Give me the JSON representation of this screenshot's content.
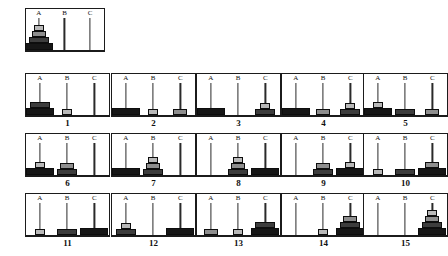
{
  "figure": {
    "peg_labels": [
      "A",
      "B",
      "C"
    ],
    "disk_colors": {
      "disk1_smallest": "#b9b9b9",
      "disk2": "#8e8e8e",
      "disk3": "#3d3d3d",
      "disk4_largest": "#161616"
    },
    "border_color": "#1b1b1b"
  },
  "chart_data": {
    "type": "diagram",
    "title": "",
    "subtitle": "",
    "peg_labels": [
      "A",
      "B",
      "C"
    ],
    "disk_count": 4,
    "initial_state": {
      "caption": "",
      "pegs": {
        "A": [
          4,
          3,
          2,
          1
        ],
        "B": [],
        "C": []
      }
    },
    "steps": [
      {
        "caption": "1",
        "pegs": {
          "A": [
            4,
            3
          ],
          "B": [
            1
          ],
          "C": []
        }
      },
      {
        "caption": "2",
        "pegs": {
          "A": [
            4
          ],
          "B": [
            1
          ],
          "C": [
            2
          ]
        }
      },
      {
        "caption": "3",
        "pegs": {
          "A": [
            4
          ],
          "B": [],
          "C": [
            3,
            1
          ]
        }
      },
      {
        "caption": "4",
        "pegs": {
          "A": [
            4
          ],
          "B": [
            2
          ],
          "C": [
            3,
            1
          ]
        }
      },
      {
        "caption": "5",
        "pegs": {
          "A": [
            4,
            1
          ],
          "B": [
            3
          ],
          "C": [
            2
          ]
        }
      },
      {
        "caption": "6",
        "pegs": {
          "A": [
            4,
            1
          ],
          "B": [
            3,
            2
          ],
          "C": []
        }
      },
      {
        "caption": "7",
        "pegs": {
          "A": [
            4
          ],
          "B": [
            3,
            2,
            1
          ],
          "C": []
        }
      },
      {
        "caption": "8",
        "pegs": {
          "A": [],
          "B": [
            3,
            2,
            1
          ],
          "C": [
            4
          ]
        }
      },
      {
        "caption": "9",
        "pegs": {
          "A": [],
          "B": [
            3,
            2
          ],
          "C": [
            4,
            1
          ]
        }
      },
      {
        "caption": "10",
        "pegs": {
          "A": [
            1
          ],
          "B": [
            3
          ],
          "C": [
            4,
            2
          ]
        }
      },
      {
        "caption": "11",
        "pegs": {
          "A": [
            1
          ],
          "B": [
            3
          ],
          "C": [
            4
          ]
        }
      },
      {
        "caption": "12",
        "pegs": {
          "A": [
            3,
            1
          ],
          "B": [],
          "C": [
            4
          ]
        }
      },
      {
        "caption": "13",
        "pegs": {
          "A": [
            2
          ],
          "B": [
            1
          ],
          "C": [
            4,
            3
          ]
        }
      },
      {
        "caption": "14",
        "pegs": {
          "A": [],
          "B": [
            1
          ],
          "C": [
            4,
            3,
            2
          ]
        }
      },
      {
        "caption": "15",
        "pegs": {
          "A": [],
          "B": [],
          "C": [
            4,
            3,
            2,
            1
          ]
        }
      }
    ]
  }
}
